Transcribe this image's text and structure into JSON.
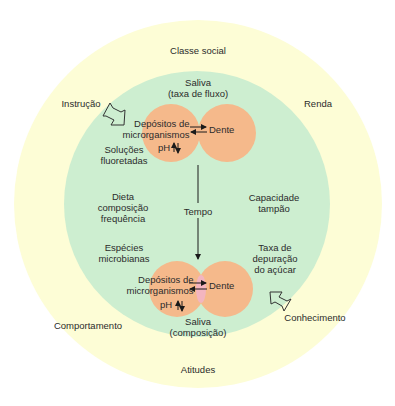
{
  "diagram": {
    "title": "",
    "colors": {
      "outer_circle": "#fdfdd6",
      "inner_circle": "#cdeed0",
      "orange_circle": "#f5b98b",
      "overlap_pink": "#f3b5c0",
      "arrow": "#1a1a1a",
      "text": "#2b2b2b"
    },
    "outer_ring_labels": {
      "top": "Classe social",
      "upper_left": "Instrução",
      "upper_right": "Renda",
      "lower_left": "Comportamento",
      "lower_right": "Conhecimento",
      "bottom": "Atitudes"
    },
    "inner_circle_labels": {
      "saliva_top": "Saliva\n(taxa de fluxo)",
      "fluoride": "Soluções\nfluoretadas",
      "diet": "Dieta\ncomposição\nfrequência",
      "microbial_species": "Espécies\nmicrobianas",
      "buffer": "Capacidade\ntampão",
      "sugar_clearance": "Taxa de\ndepuração\ndo açúcar",
      "time": "Tempo",
      "saliva_bottom": "Saliva\n(composição)"
    },
    "top_pair": {
      "deposits": "Depósitos de\nmicrorganismos",
      "tooth": "Dente",
      "ph": "pH"
    },
    "bottom_pair": {
      "deposits": "Depósitos de\nmicrorganismos",
      "tooth": "Dente",
      "ph": "pH"
    },
    "icons": [
      "open-arrow-icon-instrucao",
      "open-arrow-icon-conhecimento",
      "time-arrow-icon",
      "exchange-arrows-icon",
      "ph-updown-arrows-icon"
    ]
  }
}
